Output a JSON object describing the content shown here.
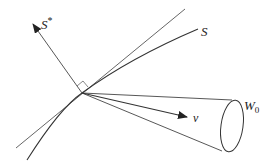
{
  "diagram": {
    "type": "geometric-cone-diagram",
    "labels": {
      "s_star": "S*",
      "s_star_base": "S",
      "s_star_sup": "*",
      "s": "S",
      "v": "v",
      "w0": "W",
      "w0_base": "W",
      "w0_sub": "0"
    },
    "colors": {
      "stroke": "#333333",
      "text": "#222222",
      "background": "#ffffff"
    }
  }
}
